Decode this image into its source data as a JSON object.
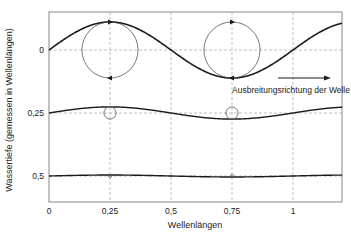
{
  "chart_data": {
    "type": "line",
    "title": "",
    "xlabel": "Wellenlängen",
    "ylabel": "Wassertiefe (gemessen in Wellenlängen)",
    "x_ticks": [
      {
        "value": 0,
        "label": "0"
      },
      {
        "value": 0.25,
        "label": "0,25"
      },
      {
        "value": 0.5,
        "label": "0,5"
      },
      {
        "value": 0.75,
        "label": "0,75"
      },
      {
        "value": 1,
        "label": "1"
      }
    ],
    "y_ticks": [
      {
        "value": 0,
        "label": "0"
      },
      {
        "value": 0.25,
        "label": "0,25"
      },
      {
        "value": 0.5,
        "label": "0,5"
      }
    ],
    "xlim": [
      0,
      1.2
    ],
    "ylim_inverted": true,
    "grid": "dashed",
    "series": [
      {
        "name": "Oberfläche (Tiefe 0)",
        "depth": 0,
        "amplitude": 0.115,
        "crest_x": 0.25,
        "orbit_radius": 0.115
      },
      {
        "name": "Tiefe 0,25",
        "depth": 0.25,
        "amplitude": 0.025,
        "crest_x": 0.25,
        "orbit_radius": 0.025
      },
      {
        "name": "Tiefe 0,5",
        "depth": 0.5,
        "amplitude": 0.004,
        "crest_x": 0.25,
        "orbit_radius": 0.004
      }
    ],
    "orbit_positions_x": [
      0.25,
      0.75
    ],
    "annotations": [
      {
        "text": "Ausbreitungsrichtung der Welle",
        "type": "arrow",
        "direction": "right"
      }
    ]
  },
  "colors": {
    "curve": "#1a1a1a",
    "orbit": "#555555",
    "grid": "#b0b0b0",
    "frame": "#888888"
  }
}
